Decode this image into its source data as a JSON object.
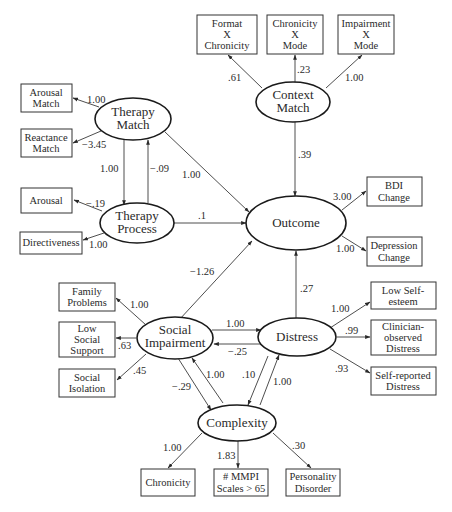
{
  "diagram": {
    "type": "structural-equation-model",
    "latent": {
      "context_match": [
        "Context",
        "Match"
      ],
      "therapy_match": [
        "Therapy",
        "Match"
      ],
      "therapy_process": [
        "Therapy",
        "Process"
      ],
      "outcome": [
        "Outcome"
      ],
      "social_impairment": [
        "Social",
        "Impairment"
      ],
      "distress": [
        "Distress"
      ],
      "complexity": [
        "Complexity"
      ]
    },
    "observed": {
      "format_x_chronicity": [
        "Format",
        "X",
        "Chronicity"
      ],
      "chronicity_x_mode": [
        "Chronicity",
        "X",
        "Mode"
      ],
      "impairment_x_mode": [
        "Impairment",
        "X",
        "Mode"
      ],
      "arousal_match": [
        "Arousal",
        "Match"
      ],
      "reactance_match": [
        "Reactance",
        "Match"
      ],
      "arousal": [
        "Arousal"
      ],
      "directiveness": [
        "Directiveness"
      ],
      "bdi_change": [
        "BDI",
        "Change"
      ],
      "depression_change": [
        "Depression",
        "Change"
      ],
      "family_problems": [
        "Family",
        "Problems"
      ],
      "low_social_support": [
        "Low",
        "Social",
        "Support"
      ],
      "social_isolation": [
        "Social",
        "Isolation"
      ],
      "low_self_esteem": [
        "Low Self-",
        "esteem"
      ],
      "clinician_observed_distress": [
        "Clinician-",
        "observed",
        "Distress"
      ],
      "self_reported_distress": [
        "Self-reported",
        "Distress"
      ],
      "chronicity": [
        "Chronicity"
      ],
      "mmpi_scales": [
        "# MMPI",
        "Scales > 65"
      ],
      "personality_disorder": [
        "Personality",
        "Disorder"
      ]
    },
    "weights": {
      "cm_format": ".61",
      "cm_chron": ".23",
      "cm_impair": "1.00",
      "cm_outcome": ".39",
      "tm_arousalmatch": "1.00",
      "tm_reactance": "−3.45",
      "tm_tp": "1.00",
      "tp_tm": "−.09",
      "tm_outcome": "1.00",
      "tp_arousal": "−.19",
      "tp_directiveness": "1.00",
      "tp_outcome": ".1",
      "out_bdi": "3.00",
      "out_depression": "1.00",
      "si_outcome": "−1.26",
      "dist_outcome": ".27",
      "si_family": "1.00",
      "si_support": ".63",
      "si_isolation": ".45",
      "si_dist": "1.00",
      "dist_si": "−.25",
      "dist_selfesteem": "1.00",
      "dist_clinician": ".99",
      "dist_selfreport": ".93",
      "si_cx": "−.29",
      "cx_si": "1.00",
      "dist_cx": ".10",
      "cx_dist": "1.00",
      "cx_chron": "1.00",
      "cx_mmpi": "1.83",
      "cx_pd": ".30"
    }
  }
}
